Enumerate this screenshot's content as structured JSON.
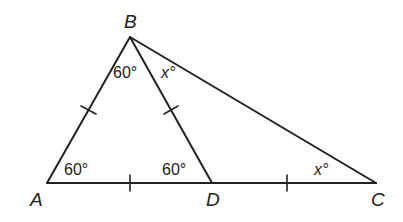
{
  "diagram": {
    "type": "geometry-triangle",
    "vertices": {
      "A": {
        "label": "A",
        "x": 47,
        "y": 183
      },
      "B": {
        "label": "B",
        "x": 130,
        "y": 37
      },
      "C": {
        "label": "C",
        "x": 376,
        "y": 183
      },
      "D": {
        "label": "D",
        "x": 212,
        "y": 183
      }
    },
    "segments": [
      "AB",
      "BC",
      "BD",
      "AD",
      "DC"
    ],
    "congruence_ticks": [
      "AB",
      "BD",
      "AD",
      "DC"
    ],
    "angles": {
      "A": {
        "value": "60",
        "unit": "°",
        "text": "60°"
      },
      "ABD": {
        "value": "60",
        "unit": "°",
        "text": "60°"
      },
      "ADB": {
        "value": "60",
        "unit": "°",
        "text": "60°"
      },
      "DBC": {
        "value": "x",
        "unit": "°",
        "text": "x°"
      },
      "C": {
        "value": "x",
        "unit": "°",
        "text": "x°"
      }
    },
    "stroke_color": "#222222",
    "background_color": "#ffffff"
  }
}
